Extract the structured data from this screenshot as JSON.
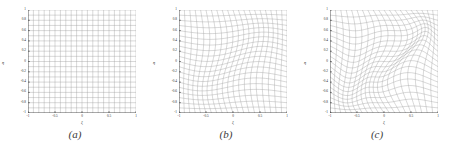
{
  "figure": {
    "panel_count": 3,
    "background_color": "#ffffff",
    "grid_color": "#9a9a9a",
    "axis_color": "#2e2e2e"
  },
  "chart_data": [
    {
      "type": "line",
      "title": "",
      "caption": "(a)",
      "xlabel": "ξ",
      "ylabel": "η",
      "xlim": [
        -1,
        1
      ],
      "ylim": [
        -1,
        1
      ],
      "xticks": [
        -1,
        -0.5,
        0,
        0.5,
        1
      ],
      "xtick_labels": [
        "-1",
        "-0.5",
        "0",
        "0.5",
        "1"
      ],
      "yticks": [
        1,
        0.8,
        0.6,
        0.4,
        0.2,
        0,
        -0.2,
        -0.4,
        -0.6,
        -0.8,
        -1
      ],
      "ytick_labels": [
        "1",
        "0.8",
        "0.6",
        "0.4",
        "0.2",
        "0",
        "-0.2",
        "-0.4",
        "-0.6",
        "-0.8",
        "-1"
      ],
      "grid": true,
      "legend": null,
      "description": "Undeformed uniform computational mesh on the reference square",
      "mesh": {
        "n_lines": 21,
        "deform_amplitude": 0.0,
        "deform_mode": 0
      }
    },
    {
      "type": "line",
      "title": "",
      "caption": "(b)",
      "xlabel": "ξ",
      "ylabel": "η",
      "xlim": [
        -1,
        1
      ],
      "ylim": [
        -1,
        1
      ],
      "xticks": [
        -1,
        -0.5,
        0,
        0.5,
        1
      ],
      "xtick_labels": [
        "-1",
        "-0.5",
        "0",
        "0.5",
        "1"
      ],
      "yticks": [
        1,
        0.8,
        0.6,
        0.4,
        0.2,
        0,
        -0.2,
        -0.4,
        -0.6,
        -0.8,
        -1
      ],
      "ytick_labels": [
        "1",
        "0.8",
        "0.6",
        "0.4",
        "0.2",
        "0",
        "-0.2",
        "-0.4",
        "-0.6",
        "-0.8",
        "-1"
      ],
      "grid": true,
      "legend": null,
      "description": "Moderately deformed curvilinear mesh with sinusoidal warping",
      "mesh": {
        "n_lines": 21,
        "deform_amplitude": 0.1,
        "deform_mode": 1
      }
    },
    {
      "type": "line",
      "title": "",
      "caption": "(c)",
      "xlabel": "ξ",
      "ylabel": "η",
      "xlim": [
        -1,
        1
      ],
      "ylim": [
        -1,
        1
      ],
      "xticks": [
        -1,
        -0.5,
        0,
        0.5,
        1
      ],
      "xtick_labels": [
        "-1",
        "-0.5",
        "0",
        "0.5",
        "1"
      ],
      "yticks": [
        1,
        0.8,
        0.6,
        0.4,
        0.2,
        0,
        -0.2,
        -0.4,
        -0.6,
        -0.8,
        -1
      ],
      "ytick_labels": [
        "1",
        "0.8",
        "0.6",
        "0.4",
        "0.2",
        "0",
        "-0.2",
        "-0.4",
        "-0.6",
        "-0.8",
        "-1"
      ],
      "grid": true,
      "legend": null,
      "description": "Strongly deformed curvilinear mesh with large sinusoidal warping",
      "mesh": {
        "n_lines": 21,
        "deform_amplitude": 0.2,
        "deform_mode": 2
      }
    }
  ]
}
